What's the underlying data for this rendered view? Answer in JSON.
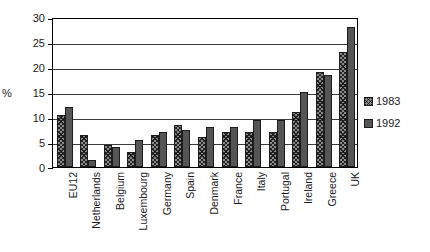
{
  "chart_data": {
    "type": "bar",
    "title": "",
    "subtitle": "",
    "xlabel": "",
    "ylabel": "%",
    "ylim": [
      0,
      30
    ],
    "yticks": [
      0,
      5,
      10,
      15,
      20,
      25,
      30
    ],
    "ytick_labels": [
      "0",
      "5",
      "10",
      "15",
      "20",
      "25",
      "30"
    ],
    "grid": true,
    "legend_position": "right",
    "categories": [
      "EU12",
      "Netherlands",
      "Belgium",
      "Luxembourg",
      "Germany",
      "Spain",
      "Denmark",
      "France",
      "Italy",
      "Portugal",
      "Ireland",
      "Greece",
      "UK"
    ],
    "series": [
      {
        "name": "1983",
        "pattern": "hatched",
        "color": "#8a8a8a",
        "values": [
          10.5,
          6.5,
          4.5,
          3.0,
          6.5,
          8.5,
          6.0,
          7.0,
          7.0,
          7.0,
          11.0,
          19.0,
          23.0
        ]
      },
      {
        "name": "1992",
        "pattern": "solid",
        "color": "#555555",
        "values": [
          12.0,
          1.5,
          4.0,
          5.5,
          7.0,
          7.5,
          8.0,
          8.0,
          9.5,
          9.5,
          15.0,
          18.5,
          28.0
        ]
      }
    ]
  },
  "legend": {
    "entries": [
      {
        "label": "1983"
      },
      {
        "label": "1992"
      }
    ]
  },
  "axis": {
    "percent_symbol": "%"
  }
}
